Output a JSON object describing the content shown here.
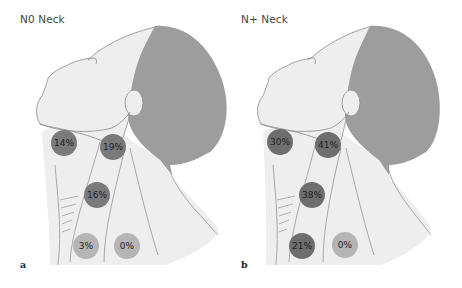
{
  "figure": {
    "panels": [
      {
        "letter": "a",
        "title": "N0 Neck",
        "nodes": [
          {
            "label": "14%",
            "level": "I",
            "color": "#7a7a7a"
          },
          {
            "label": "19%",
            "level": "II",
            "color": "#7a7a7a"
          },
          {
            "label": "16%",
            "level": "III",
            "color": "#7a7a7a"
          },
          {
            "label": "3%",
            "level": "IV",
            "color": "#b5b5b5"
          },
          {
            "label": "0%",
            "level": "V",
            "color": "#b5b5b5"
          }
        ]
      },
      {
        "letter": "b",
        "title": "N+ Neck",
        "nodes": [
          {
            "label": "30%",
            "level": "I",
            "color": "#6e6e6e"
          },
          {
            "label": "41%",
            "level": "II",
            "color": "#6e6e6e"
          },
          {
            "label": "38%",
            "level": "III",
            "color": "#6e6e6e"
          },
          {
            "label": "21%",
            "level": "IV",
            "color": "#6e6e6e"
          },
          {
            "label": "0%",
            "level": "V",
            "color": "#b5b5b5"
          }
        ]
      }
    ],
    "colors": {
      "skin": "#ebebeb",
      "hair": "#9d9d9d",
      "outline": "#8a8a8a"
    }
  }
}
